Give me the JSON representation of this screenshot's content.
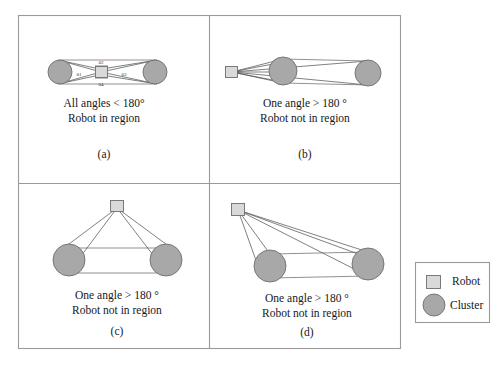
{
  "figure": {
    "panels": [
      {
        "id": "a",
        "caption": "(a)",
        "line1": "All angles < 180°",
        "line2": "Robot in region",
        "angle_labels": [
          "θ1",
          "θ2",
          "θ3",
          "θ4"
        ],
        "robot_position": "center",
        "cluster_count": 2
      },
      {
        "id": "b",
        "caption": "(b)",
        "line1": "One angle > 180 °",
        "line2": "Robot not in region",
        "angle_labels": [],
        "robot_position": "left-outside",
        "cluster_count": 2
      },
      {
        "id": "c",
        "caption": "(c)",
        "line1": "One angle > 180 °",
        "line2": "Robot not in region",
        "angle_labels": [],
        "robot_position": "top-center",
        "cluster_count": 2
      },
      {
        "id": "d",
        "caption": "(d)",
        "line1": "One angle > 180 °",
        "line2": "Robot not in region",
        "angle_labels": [],
        "robot_position": "top-left",
        "cluster_count": 2
      }
    ],
    "legend": {
      "robot_label": "Robot",
      "cluster_label": "Cluster"
    },
    "colors": {
      "cluster_fill": "#a8a8a8",
      "robot_fill": "#d9d9d9",
      "shape_stroke": "#6e6e6e",
      "ray_stroke": "#4a4a4a",
      "frame_stroke": "#9a9a9a",
      "background": "#ffffff",
      "text": "#16181a"
    }
  }
}
